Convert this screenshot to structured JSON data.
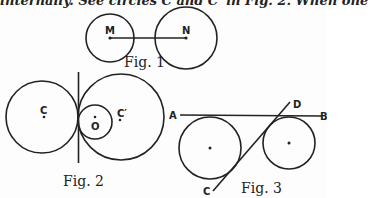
{
  "text": {
    "top_line": "internally. See circles C and C′ in Fig. 2. When one"
  },
  "figures": [
    {
      "caption": "Fig. 1",
      "labels": {
        "m": "M",
        "n": "N"
      }
    },
    {
      "caption": "Fig. 2",
      "labels": {
        "c": "C",
        "c_prime": "C′",
        "o": "O"
      }
    },
    {
      "caption": "Fig. 3",
      "labels": {
        "a": "A",
        "b": "B",
        "c": "C",
        "d": "D"
      }
    }
  ],
  "colors": {
    "ink": "#222222",
    "paper": "#fdfdfd"
  }
}
